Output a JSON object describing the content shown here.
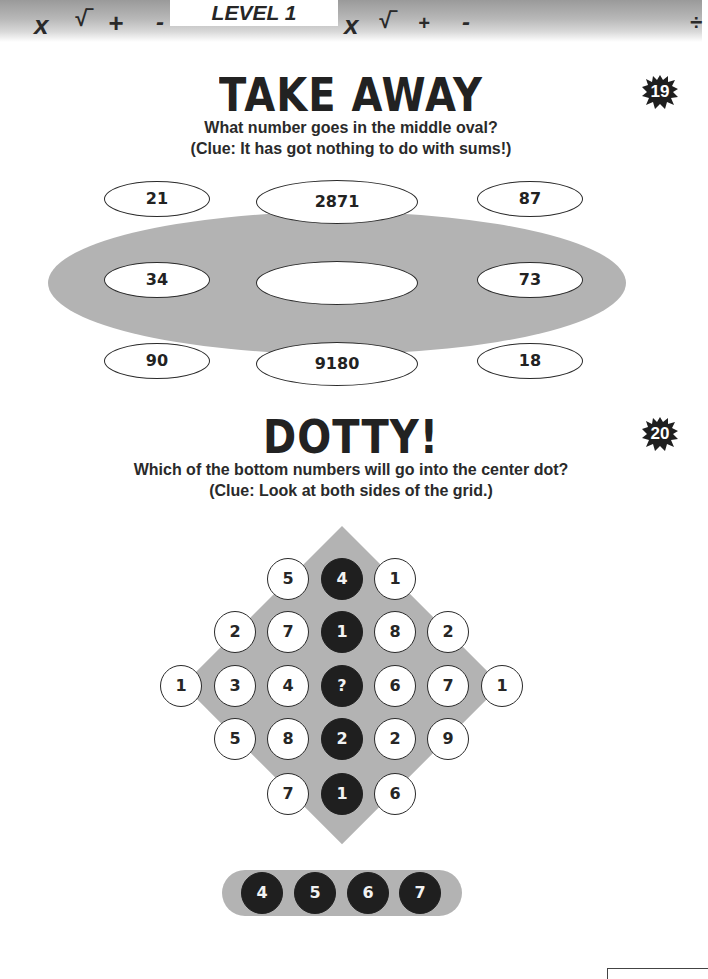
{
  "header": {
    "level_label": "LEVEL 1",
    "symbols": [
      {
        "char": "x",
        "x": 34,
        "y": 10,
        "size": 26
      },
      {
        "char": "√‾",
        "x": 74,
        "y": 6,
        "size": 22
      },
      {
        "char": "+",
        "x": 108,
        "y": 8,
        "size": 26
      },
      {
        "char": "-",
        "x": 156,
        "y": 8,
        "size": 24
      },
      {
        "char": "x",
        "x": 344,
        "y": 10,
        "size": 26
      },
      {
        "char": "√‾",
        "x": 378,
        "y": 8,
        "size": 22
      },
      {
        "char": "+",
        "x": 418,
        "y": 12,
        "size": 20
      },
      {
        "char": "-",
        "x": 462,
        "y": 8,
        "size": 24
      },
      {
        "char": "÷",
        "x": 690,
        "y": 10,
        "size": 22
      }
    ]
  },
  "puzzle_19": {
    "number": "19",
    "title": "TAKE AWAY",
    "question": "What number goes in the middle oval?",
    "clue": "(Clue: It has got nothing to do with sums!)",
    "ovals": [
      {
        "value": "21",
        "row": "top",
        "pos": "left"
      },
      {
        "value": "2871",
        "row": "top",
        "pos": "center"
      },
      {
        "value": "87",
        "row": "top",
        "pos": "right"
      },
      {
        "value": "34",
        "row": "middle",
        "pos": "left"
      },
      {
        "value": "",
        "row": "middle",
        "pos": "center"
      },
      {
        "value": "73",
        "row": "middle",
        "pos": "right"
      },
      {
        "value": "90",
        "row": "bottom",
        "pos": "left"
      },
      {
        "value": "9180",
        "row": "bottom",
        "pos": "center"
      },
      {
        "value": "18",
        "row": "bottom",
        "pos": "right"
      }
    ]
  },
  "puzzle_20": {
    "number": "20",
    "title": "DOTTY!",
    "question": "Which of the bottom numbers will go into the center dot?",
    "clue": "(Clue: Look at both sides of the grid.)",
    "grid": [
      {
        "row": 0,
        "col": 2,
        "value": "5",
        "color": "white"
      },
      {
        "row": 0,
        "col": 3,
        "value": "4",
        "color": "black"
      },
      {
        "row": 0,
        "col": 4,
        "value": "1",
        "color": "white"
      },
      {
        "row": 1,
        "col": 1,
        "value": "2",
        "color": "white"
      },
      {
        "row": 1,
        "col": 2,
        "value": "7",
        "color": "white"
      },
      {
        "row": 1,
        "col": 3,
        "value": "1",
        "color": "black"
      },
      {
        "row": 1,
        "col": 4,
        "value": "8",
        "color": "white"
      },
      {
        "row": 1,
        "col": 5,
        "value": "2",
        "color": "white"
      },
      {
        "row": 2,
        "col": 0,
        "value": "1",
        "color": "white"
      },
      {
        "row": 2,
        "col": 1,
        "value": "3",
        "color": "white"
      },
      {
        "row": 2,
        "col": 2,
        "value": "4",
        "color": "white"
      },
      {
        "row": 2,
        "col": 3,
        "value": "?",
        "color": "black"
      },
      {
        "row": 2,
        "col": 4,
        "value": "6",
        "color": "white"
      },
      {
        "row": 2,
        "col": 5,
        "value": "7",
        "color": "white"
      },
      {
        "row": 2,
        "col": 6,
        "value": "1",
        "color": "white"
      },
      {
        "row": 3,
        "col": 1,
        "value": "5",
        "color": "white"
      },
      {
        "row": 3,
        "col": 2,
        "value": "8",
        "color": "white"
      },
      {
        "row": 3,
        "col": 3,
        "value": "2",
        "color": "black"
      },
      {
        "row": 3,
        "col": 4,
        "value": "2",
        "color": "white"
      },
      {
        "row": 3,
        "col": 5,
        "value": "9",
        "color": "white"
      },
      {
        "row": 4,
        "col": 2,
        "value": "7",
        "color": "white"
      },
      {
        "row": 4,
        "col": 3,
        "value": "1",
        "color": "black"
      },
      {
        "row": 4,
        "col": 4,
        "value": "6",
        "color": "white"
      }
    ],
    "answer_options": [
      "4",
      "5",
      "6",
      "7"
    ]
  },
  "colors": {
    "shape_gray": "#b3b3b3",
    "dark_dot": "#1f1f1f",
    "text": "#222222"
  }
}
